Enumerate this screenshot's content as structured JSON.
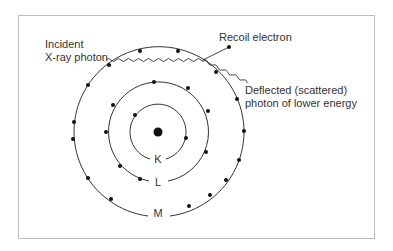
{
  "diagram": {
    "labels": {
      "incident_line1": "Incident",
      "incident_line2": "X-ray photon",
      "recoil": "Recoil electron",
      "deflected_line1": "Deflected (scattered)",
      "deflected_line2": "photon of lower energy"
    },
    "shells": [
      {
        "name": "K",
        "radius": 28
      },
      {
        "name": "L",
        "radius": 50
      },
      {
        "name": "M",
        "radius": 85
      }
    ],
    "colors": {
      "line": "#333333",
      "dot": "#111111",
      "frame": "#bdbdbd"
    }
  }
}
